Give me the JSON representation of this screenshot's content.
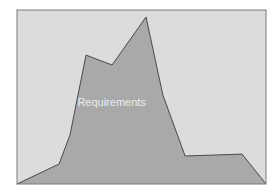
{
  "chart_data": {
    "type": "area",
    "title": "",
    "xlabel": "",
    "ylabel": "",
    "xlim": [
      0,
      100
    ],
    "ylim": [
      0,
      100
    ],
    "grid": false,
    "legend": "none",
    "axes_visible": false,
    "series": [
      {
        "name": "Requirements",
        "label": "Requirements",
        "x": [
          0,
          16.9,
          21.3,
          27.7,
          38.2,
          51.8,
          58.6,
          67.5,
          90.4,
          100
        ],
        "y": [
          0,
          11.5,
          28.2,
          74.1,
          68.4,
          96.0,
          51.1,
          16.1,
          17.2,
          0
        ]
      }
    ],
    "annotations": [
      {
        "text": "Requirements",
        "series": "Requirements"
      }
    ],
    "colors": {
      "background": "#dcdcdc",
      "area_fill": "#a9a9a9",
      "area_stroke": "#4a4a4a",
      "frame": "#7a7a7a",
      "label": "#ececec"
    }
  }
}
